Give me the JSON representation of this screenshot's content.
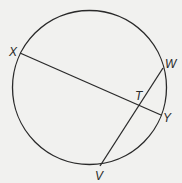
{
  "diagram": {
    "type": "circle-with-intersecting-chords",
    "top_cut_text": "",
    "circle": {
      "cx": 89.5,
      "cy": 87.5,
      "r": 77
    },
    "points": {
      "X": {
        "label": "X",
        "x": 20,
        "y": 53
      },
      "W": {
        "label": "W",
        "x": 163,
        "y": 68
      },
      "Y": {
        "label": "Y",
        "x": 161,
        "y": 115
      },
      "V": {
        "label": "V",
        "x": 100,
        "y": 166
      },
      "T": {
        "label": "T",
        "x": 139,
        "y": 106
      }
    },
    "chords": [
      {
        "name": "XY",
        "from": "X",
        "to": "Y"
      },
      {
        "name": "WV",
        "from": "W",
        "to": "V"
      }
    ],
    "intersection": "T",
    "colors": {
      "stroke": "#2a2a2a",
      "background": "#f1f1ef"
    }
  }
}
